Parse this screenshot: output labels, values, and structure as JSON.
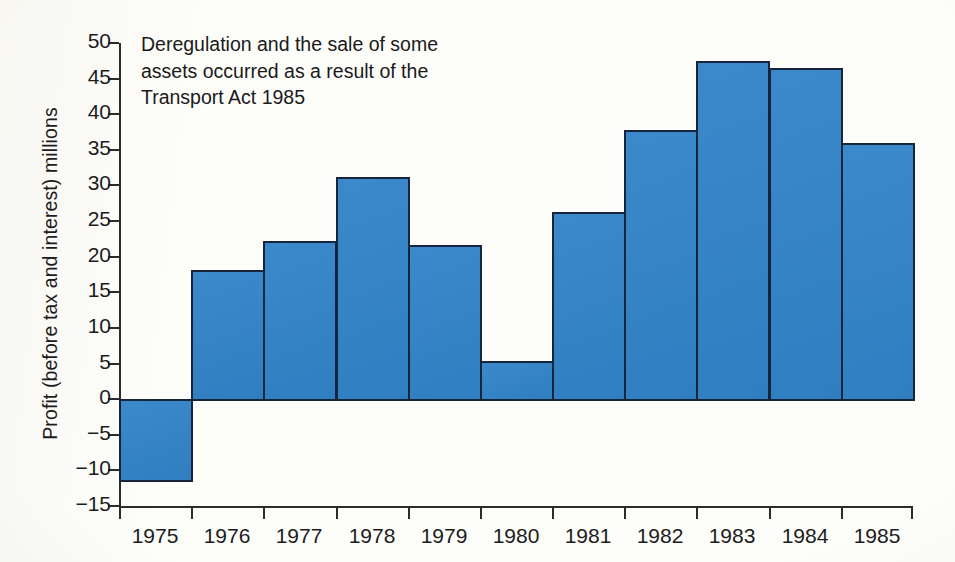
{
  "chart_data": {
    "type": "bar",
    "title": "",
    "xlabel": "",
    "ylabel": "Profit (before tax and interest) millions",
    "categories": [
      "1975",
      "1976",
      "1977",
      "1978",
      "1979",
      "1980",
      "1981",
      "1982",
      "1983",
      "1984",
      "1985"
    ],
    "values": [
      -11.3,
      18.2,
      22.2,
      31.2,
      21.7,
      5.3,
      26.3,
      37.8,
      47.5,
      46.5,
      36.0
    ],
    "ylim": [
      -15,
      50
    ],
    "ytick_labels": [
      "50",
      "45",
      "40",
      "35",
      "30",
      "25",
      "20",
      "15",
      "10",
      "5",
      "0",
      "−5",
      "−10",
      "−15"
    ],
    "ytick_values": [
      50,
      45,
      40,
      35,
      30,
      25,
      20,
      15,
      10,
      5,
      0,
      -5,
      -10,
      -15
    ],
    "grid": false,
    "legend": null,
    "annotations": [
      {
        "lines": [
          "Deregulation and the sale of some",
          "assets occurred as a result of the",
          "Transport Act 1985"
        ]
      }
    ],
    "colors": {
      "bar_fill": "#3183c8",
      "bar_edge": "#18233c",
      "axis": "#2b2b2b",
      "text": "#1a1a1a",
      "background": "#fdfdfa"
    }
  }
}
